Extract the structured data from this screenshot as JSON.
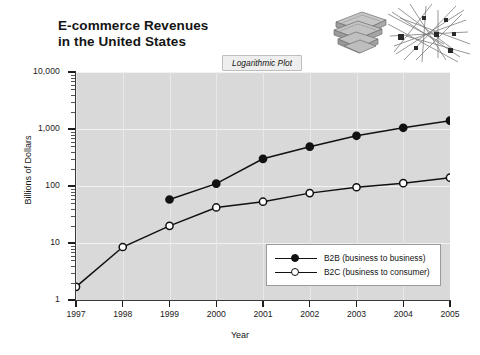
{
  "chart_data": {
    "type": "line",
    "title": "E-commerce Revenues\nin the United States",
    "annotation": "Logarithmic Plot",
    "xlabel": "Year",
    "ylabel": "Billions of Dollars",
    "x": [
      1997,
      1998,
      1999,
      2000,
      2001,
      2002,
      2003,
      2004,
      2005
    ],
    "categories": [
      "1997",
      "1998",
      "1999",
      "2000",
      "2001",
      "2002",
      "2003",
      "2004",
      "2005"
    ],
    "yscale": "log",
    "ylim": [
      1,
      10000
    ],
    "xlim": [
      1997,
      2005
    ],
    "grid": true,
    "legend_position": "inside-bottom-right",
    "y_tick_labels": [
      "1",
      "10",
      "100",
      "1,000",
      "10,000"
    ],
    "y_tick_values": [
      1,
      10,
      100,
      1000,
      10000
    ],
    "series": [
      {
        "name": "B2B (business to business)",
        "short": "B2B",
        "marker": "filled-circle",
        "x": [
          1999,
          2000,
          2001,
          2002,
          2003,
          2004,
          2005
        ],
        "values": [
          58,
          110,
          300,
          490,
          760,
          1050,
          1400
        ]
      },
      {
        "name": "B2C (business to consumer)",
        "short": "B2C",
        "marker": "open-circle",
        "x": [
          1997,
          1998,
          1999,
          2000,
          2001,
          2002,
          2003,
          2004,
          2005
        ],
        "values": [
          1.7,
          8.5,
          20,
          42,
          53,
          75,
          95,
          112,
          140
        ]
      }
    ]
  },
  "legend": {
    "items": [
      {
        "label": "B2B (business to business)",
        "marker": "filled-circle"
      },
      {
        "label": "B2C (business to consumer)",
        "marker": "open-circle"
      }
    ]
  },
  "decor": {
    "money": "stack-of-money-illustration",
    "network": "network-nodes-illustration"
  },
  "colors": {
    "plot_background": "#d9d9d9",
    "page_background": "#ffffff",
    "line": "#111111",
    "gridline": "#f2f2f2",
    "annotation_background": "#eeeeee"
  }
}
